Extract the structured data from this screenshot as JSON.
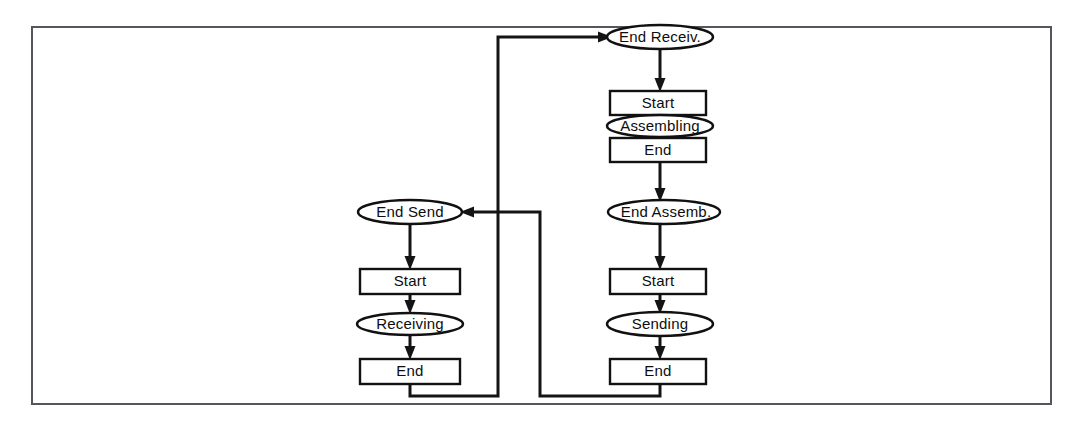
{
  "diagram": {
    "type": "state-flow-diagram",
    "background_color": "#ffffff",
    "line_color": "#141414",
    "frame_color": "#55555c",
    "text_color": "#0d0d0d",
    "frame": {
      "x": 32,
      "y": 27,
      "width": 1019,
      "height": 377
    },
    "columns": [
      {
        "name": "left-column",
        "nodes": [
          "end-send",
          "start-receiving",
          "receiving",
          "end-receiving"
        ]
      },
      {
        "name": "right-column",
        "nodes": [
          "end-receive",
          "start-assembling",
          "assembling",
          "end-assembling",
          "end-assemb",
          "start-sending",
          "sending",
          "end-sending"
        ]
      }
    ],
    "nodes": [
      {
        "id": "end-receive",
        "label": "End Receiv.",
        "shape": "ellipse",
        "cx": 660,
        "cy": 37,
        "rx": 53,
        "ry": 12
      },
      {
        "id": "start-assembling",
        "label": "Start",
        "shape": "rect",
        "x": 610,
        "y": 91,
        "width": 96,
        "height": 24
      },
      {
        "id": "assembling",
        "label": "Assembling",
        "shape": "ellipse",
        "cx": 660,
        "cy": 126,
        "rx": 53,
        "ry": 11
      },
      {
        "id": "end-assembling",
        "label": "End",
        "shape": "rect",
        "x": 610,
        "y": 138,
        "width": 96,
        "height": 24
      },
      {
        "id": "end-assemb",
        "label": "End Assemb.",
        "shape": "ellipse",
        "cx": 664,
        "cy": 212,
        "rx": 56,
        "ry": 12
      },
      {
        "id": "start-sending",
        "label": "Start",
        "shape": "rect",
        "x": 610,
        "y": 269,
        "width": 96,
        "height": 25
      },
      {
        "id": "sending",
        "label": "Sending",
        "shape": "ellipse",
        "cx": 660,
        "cy": 324,
        "rx": 53,
        "ry": 12
      },
      {
        "id": "end-sending",
        "label": "End",
        "shape": "rect",
        "x": 610,
        "y": 359,
        "width": 96,
        "height": 25
      },
      {
        "id": "end-send",
        "label": "End Send",
        "shape": "ellipse",
        "cx": 410,
        "cy": 212,
        "rx": 52,
        "ry": 12
      },
      {
        "id": "start-receiving",
        "label": "Start",
        "shape": "rect",
        "x": 360,
        "y": 269,
        "width": 100,
        "height": 25
      },
      {
        "id": "receiving",
        "label": "Receiving",
        "shape": "ellipse",
        "cx": 410,
        "cy": 324,
        "rx": 53,
        "ry": 11
      },
      {
        "id": "end-receiving",
        "label": "End",
        "shape": "rect",
        "x": 360,
        "y": 359,
        "width": 100,
        "height": 25
      }
    ],
    "edges": [
      {
        "id": "edge-end-receive-to-start-assembling",
        "from": "end-receive",
        "to": "start-assembling",
        "kind": "straight-down",
        "arrow": true
      },
      {
        "id": "edge-end-assembling-to-end-assemb",
        "from": "end-assembling",
        "to": "end-assemb",
        "kind": "straight-down",
        "arrow": true
      },
      {
        "id": "edge-end-assemb-to-start-sending",
        "from": "end-assemb",
        "to": "start-sending",
        "kind": "straight-down",
        "arrow": true
      },
      {
        "id": "edge-start-sending-to-sending",
        "from": "start-sending",
        "to": "sending",
        "kind": "straight-down",
        "arrow": true
      },
      {
        "id": "edge-sending-to-end-sending",
        "from": "sending",
        "to": "end-sending",
        "kind": "straight-down",
        "arrow": true
      },
      {
        "id": "edge-end-send-to-start-receiving",
        "from": "end-send",
        "to": "start-receiving",
        "kind": "straight-down",
        "arrow": true
      },
      {
        "id": "edge-start-receiving-to-receiving",
        "from": "start-receiving",
        "to": "receiving",
        "kind": "straight-down",
        "arrow": true
      },
      {
        "id": "edge-receiving-to-end-receiving",
        "from": "receiving",
        "to": "end-receiving",
        "kind": "straight-down",
        "arrow": true
      },
      {
        "id": "edge-end-receiving-to-end-receive",
        "from": "end-receiving",
        "to": "end-receive",
        "kind": "orthogonal-feedback-left",
        "arrow": true
      },
      {
        "id": "edge-end-sending-to-end-send",
        "from": "end-sending",
        "to": "end-send",
        "kind": "orthogonal-feedback-right",
        "arrow": true
      }
    ]
  }
}
